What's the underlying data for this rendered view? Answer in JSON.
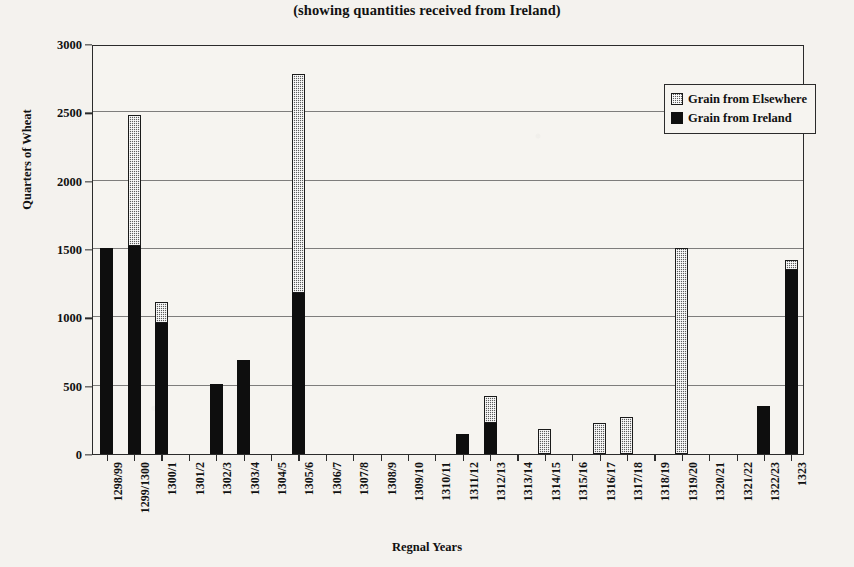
{
  "subtitle": "(showing quantities received from Ireland)",
  "axes": {
    "ylabel": "Quarters of Wheat",
    "xlabel": "Regnal Years"
  },
  "legend": {
    "items": [
      {
        "label": "Grain from Elsewhere",
        "swatch": "hatched-grey"
      },
      {
        "label": "Grain from Ireland",
        "swatch": "solid-black"
      }
    ]
  },
  "chart_data": {
    "type": "bar",
    "subtype": "stacked",
    "title": "(showing quantities received from Ireland)",
    "xlabel": "Regnal Years",
    "ylabel": "Quarters of Wheat",
    "ylim": [
      0,
      3000
    ],
    "yticks": [
      0,
      500,
      1000,
      1500,
      2000,
      2500,
      3000
    ],
    "grid": true,
    "legend_position": "upper-right-inside",
    "categories": [
      "1298/99",
      "1299/1300",
      "1300/1",
      "1301/2",
      "1302/3",
      "1303/4",
      "1304/5",
      "1305/6",
      "1306/7",
      "1307/8",
      "1308/9",
      "1309/10",
      "1310/11",
      "1311/12",
      "1312/13",
      "1313/14",
      "1314/15",
      "1315/16",
      "1316/17",
      "1317/18",
      "1318/19",
      "1319/20",
      "1320/21",
      "1321/22",
      "1322/23",
      "1323"
    ],
    "series": [
      {
        "name": "Grain from Ireland",
        "color": "#0e0e0e",
        "values": [
          1510,
          1520,
          960,
          0,
          510,
          690,
          0,
          1180,
          0,
          0,
          0,
          0,
          0,
          145,
          230,
          0,
          0,
          0,
          0,
          0,
          0,
          0,
          0,
          0,
          350,
          1350
        ]
      },
      {
        "name": "Grain from Elsewhere",
        "color": "#5d5d5d",
        "values": [
          0,
          960,
          150,
          0,
          0,
          0,
          0,
          1600,
          0,
          0,
          0,
          0,
          0,
          0,
          195,
          0,
          180,
          0,
          230,
          270,
          0,
          1510,
          0,
          0,
          0,
          70
        ]
      }
    ],
    "totals": [
      1510,
      2480,
      1110,
      0,
      510,
      690,
      0,
      2780,
      0,
      0,
      0,
      0,
      0,
      145,
      425,
      0,
      180,
      0,
      230,
      270,
      0,
      1510,
      0,
      0,
      350,
      1420
    ]
  }
}
